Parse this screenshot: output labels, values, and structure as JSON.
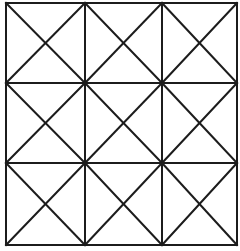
{
  "diagram": {
    "type": "grid-with-diagonals",
    "rows": 3,
    "cols": 3,
    "background": "#ffffff",
    "stroke_color": "#1c1c1c",
    "stroke_width": 2,
    "x_lines": [
      6,
      85,
      162,
      237
    ],
    "y_lines": [
      3,
      83,
      163,
      245
    ],
    "cell_diagonals": "both"
  }
}
